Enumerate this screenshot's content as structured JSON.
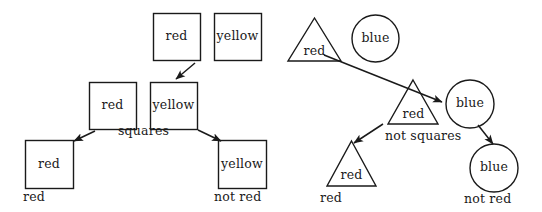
{
  "figure": {
    "background_color": "#ffffff",
    "stroke_color": "#1a1a1a",
    "text_color": "#1a1a1a",
    "width": 542,
    "height": 212
  },
  "left_group": {
    "caption": "squares",
    "nodes": [
      {
        "id": "sq-top-red",
        "shape": "square",
        "label": "red",
        "x": 153,
        "y": 13,
        "size": 47
      },
      {
        "id": "sq-top-yellow",
        "shape": "square",
        "label": "yellow",
        "x": 214,
        "y": 13,
        "size": 47
      },
      {
        "id": "sq-mid-red",
        "shape": "square",
        "label": "red",
        "x": 89,
        "y": 82,
        "size": 47
      },
      {
        "id": "sq-mid-yellow",
        "shape": "square",
        "label": "yellow",
        "x": 150,
        "y": 82,
        "size": 47
      },
      {
        "id": "sq-bot-red",
        "shape": "square",
        "label": "red",
        "x": 25,
        "y": 140,
        "size": 48
      },
      {
        "id": "sq-bot-yellow",
        "shape": "square",
        "label": "yellow",
        "x": 218,
        "y": 140,
        "size": 48
      }
    ],
    "node_captions": [
      {
        "id": "cap-sq-red",
        "text": "red",
        "x": 23,
        "y": 190
      },
      {
        "id": "cap-sq-not-red",
        "text": "not red",
        "x": 212,
        "y": 190
      }
    ]
  },
  "right_group": {
    "caption": "not squares",
    "nodes": [
      {
        "id": "tri-top-red",
        "shape": "triangle",
        "label": "red",
        "x": 288,
        "y": 18,
        "w": 53,
        "h": 43
      },
      {
        "id": "cir-top-blue",
        "shape": "circle",
        "label": "blue",
        "x": 352,
        "y": 15,
        "d": 47
      },
      {
        "id": "tri-mid-red",
        "shape": "triangle",
        "label": "red",
        "x": 388,
        "y": 80,
        "w": 50,
        "h": 44
      },
      {
        "id": "cir-mid-blue",
        "shape": "circle",
        "label": "blue",
        "x": 446,
        "y": 80,
        "d": 48
      },
      {
        "id": "tri-bot-red",
        "shape": "triangle",
        "label": "red",
        "x": 327,
        "y": 141,
        "w": 49,
        "h": 45
      },
      {
        "id": "cir-bot-blue",
        "shape": "circle",
        "label": "blue",
        "x": 470,
        "y": 144,
        "d": 48
      }
    ],
    "node_captions": [
      {
        "id": "cap-tri-red",
        "text": "red",
        "x": 320,
        "y": 191
      },
      {
        "id": "cap-cir-not-red",
        "text": "not red",
        "x": 462,
        "y": 193
      }
    ]
  },
  "captions": {
    "squares": {
      "text": "squares",
      "x": 128,
      "y": 125
    },
    "not_squares": {
      "text": "not squares",
      "x": 390,
      "y": 130
    }
  },
  "arrows": [
    {
      "id": "arrow-top-red-to-mid-yellow",
      "from": "sq-top-red",
      "to": "sq-mid-yellow",
      "x1": 194,
      "y1": 64,
      "x2": 175,
      "y2": 80
    },
    {
      "id": "arrow-mid-red-to-bot-red",
      "from": "sq-mid-red",
      "to": "sq-bot-red",
      "x1": 94,
      "y1": 131,
      "x2": 73,
      "y2": 142
    },
    {
      "id": "arrow-mid-yellow-to-bot-yellow",
      "from": "sq-mid-yellow",
      "to": "sq-bot-yellow",
      "x1": 199,
      "y1": 130,
      "x2": 222,
      "y2": 142
    },
    {
      "id": "arrow-tri-top-to-cir-mid",
      "from": "tri-top-red",
      "to": "cir-mid-blue",
      "x1": 323,
      "y1": 56,
      "x2": 440,
      "y2": 101
    },
    {
      "id": "arrow-tri-mid-to-tri-bot",
      "from": "tri-mid-red",
      "to": "tri-bot-red",
      "x1": 382,
      "y1": 125,
      "x2": 353,
      "y2": 144
    },
    {
      "id": "arrow-cir-mid-to-cir-bot",
      "from": "cir-mid-blue",
      "to": "cir-bot-blue",
      "x1": 477,
      "y1": 125,
      "x2": 492,
      "y2": 145
    }
  ]
}
